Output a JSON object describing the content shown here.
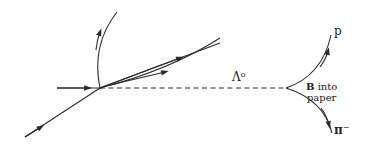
{
  "diagram": {
    "type": "bubble-chamber-track-diagram",
    "labels": {
      "lambda": "Λ",
      "lambda_sup": "o",
      "proton": "p",
      "pion": "π",
      "pion_sup": "−",
      "field_bold": "B",
      "field_rest_line1": " into",
      "field_line2": "paper"
    },
    "colors": {
      "track": "#2a2a2a",
      "background": "#ffffff"
    }
  }
}
